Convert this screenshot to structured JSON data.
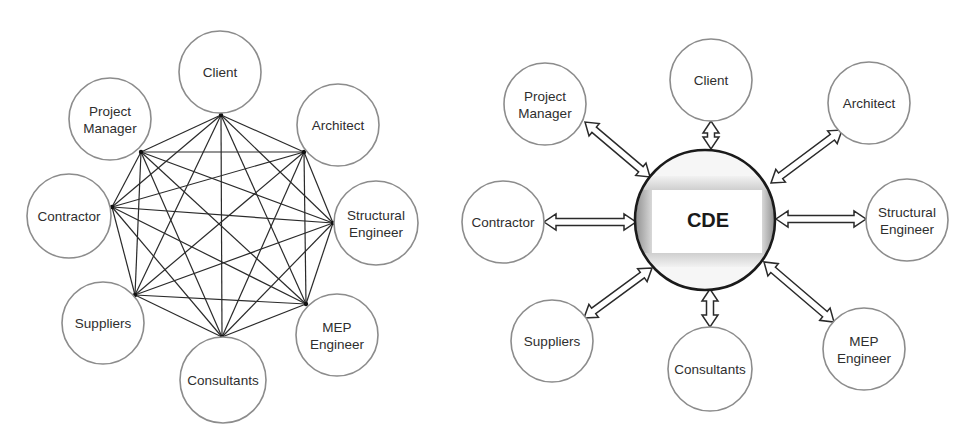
{
  "figure": {
    "left_panel": {
      "title": "Traditional point-to-point communication",
      "stakeholders": [
        {
          "id": "client",
          "lines": [
            "Client"
          ],
          "cx": 220,
          "cy": 72,
          "r": 41,
          "node": [
            221,
            115
          ]
        },
        {
          "id": "architect",
          "lines": [
            "Architect"
          ],
          "cx": 338,
          "cy": 125,
          "r": 41,
          "node": [
            304,
            152
          ]
        },
        {
          "id": "structural-engineer",
          "lines": [
            "Structural",
            "Engineer"
          ],
          "cx": 376,
          "cy": 223,
          "r": 42,
          "node": [
            333,
            223
          ]
        },
        {
          "id": "mep-engineer",
          "lines": [
            "MEP",
            "Engineer"
          ],
          "cx": 337,
          "cy": 335,
          "r": 41,
          "node": [
            306,
            304
          ]
        },
        {
          "id": "consultants",
          "lines": [
            "Consultants"
          ],
          "cx": 223,
          "cy": 380,
          "r": 43,
          "node": [
            222,
            337
          ]
        },
        {
          "id": "suppliers",
          "lines": [
            "Suppliers"
          ],
          "cx": 103,
          "cy": 323,
          "r": 41,
          "node": [
            135,
            295
          ]
        },
        {
          "id": "contractor",
          "lines": [
            "Contractor"
          ],
          "cx": 69,
          "cy": 216,
          "r": 42,
          "node": [
            112,
            207
          ]
        },
        {
          "id": "project-manager",
          "lines": [
            "Project",
            "Manager"
          ],
          "cx": 110,
          "cy": 119,
          "r": 41,
          "node": [
            141,
            152
          ]
        }
      ],
      "connection_pattern": "complete-graph"
    },
    "right_panel": {
      "title": "Communication through a Common Data Environment",
      "hub": {
        "label": "CDE",
        "cx": 705,
        "cy": 220,
        "r": 70
      },
      "stakeholders": [
        {
          "id": "client",
          "lines": [
            "Client"
          ],
          "cx": 711,
          "cy": 80,
          "r": 41,
          "arrow": [
            [
              711,
              121
            ],
            [
              711,
              149
            ]
          ]
        },
        {
          "id": "architect",
          "lines": [
            "Architect"
          ],
          "cx": 869,
          "cy": 103,
          "r": 41,
          "arrow": [
            [
              771,
              183
            ],
            [
              842,
              130
            ]
          ]
        },
        {
          "id": "structural-engineer",
          "lines": [
            "Structural",
            "Engineer"
          ],
          "cx": 907,
          "cy": 220,
          "r": 41,
          "arrow": [
            [
              776,
              219
            ],
            [
              866,
              219
            ]
          ]
        },
        {
          "id": "mep-engineer",
          "lines": [
            "MEP",
            "Engineer"
          ],
          "cx": 864,
          "cy": 349,
          "r": 41,
          "arrow": [
            [
              764,
              262
            ],
            [
              834,
              322
            ]
          ]
        },
        {
          "id": "consultants",
          "lines": [
            "Consultants"
          ],
          "cx": 710,
          "cy": 369,
          "r": 42,
          "arrow": [
            [
              710,
              289
            ],
            [
              710,
              327
            ]
          ]
        },
        {
          "id": "suppliers",
          "lines": [
            "Suppliers"
          ],
          "cx": 552,
          "cy": 341,
          "r": 41,
          "arrow": [
            [
              584,
              318
            ],
            [
              652,
              268
            ]
          ]
        },
        {
          "id": "contractor",
          "lines": [
            "Contractor"
          ],
          "cx": 503,
          "cy": 222,
          "r": 41,
          "arrow": [
            [
              544,
              222
            ],
            [
              636,
              222
            ]
          ]
        },
        {
          "id": "project-manager",
          "lines": [
            "Project",
            "Manager"
          ],
          "cx": 545,
          "cy": 104,
          "r": 41,
          "arrow": [
            [
              585,
              122
            ],
            [
              650,
              177
            ]
          ]
        }
      ]
    }
  },
  "colors": {
    "circle_stroke": "#8c8c8c",
    "label_text": "#2e2e2e",
    "edge": "#2a2a2a",
    "cde_ring": "#1a1a1a",
    "cde_shade": "#9a9a9a",
    "background": "#ffffff"
  }
}
